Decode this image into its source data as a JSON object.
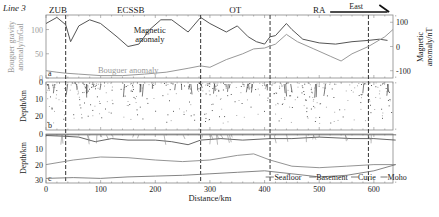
{
  "figure": {
    "line_label": "Line 3",
    "xlabel": "Distance/km",
    "direction_label": "East",
    "regions": [
      "ZUB",
      "ECSSB",
      "OT",
      "RA"
    ],
    "boundaries_km": [
      36,
      283,
      410,
      590
    ],
    "panel_letters": [
      "a",
      "b",
      "c"
    ]
  },
  "chart_data": [
    {
      "type": "line",
      "panel": "a",
      "title": "",
      "xlabel": "Distance/km",
      "ylabel_left": "Bouguer gravity anomaly/mGal",
      "ylabel_right": "Magnetic anomaly/nT",
      "xlim": [
        0,
        640
      ],
      "ylim_left": [
        0,
        130
      ],
      "ylim_right": [
        -130,
        130
      ],
      "left_ticks": [
        "0",
        "50",
        "100"
      ],
      "right_ticks": [
        "-100",
        "0",
        "100"
      ],
      "annotations": [
        "Magnetic anomaly",
        "Bouguer anomaly"
      ],
      "series": [
        {
          "name": "Magnetic anomaly",
          "axis": "right",
          "color": "#555555",
          "x": [
            0,
            20,
            36,
            45,
            60,
            80,
            100,
            130,
            150,
            170,
            190,
            210,
            230,
            260,
            283,
            300,
            330,
            350,
            370,
            385,
            400,
            410,
            420,
            440,
            450,
            470,
            500,
            530,
            560,
            590,
            610,
            625
          ],
          "values": [
            95,
            120,
            90,
            20,
            85,
            110,
            95,
            40,
            0,
            10,
            70,
            110,
            110,
            60,
            120,
            95,
            60,
            85,
            40,
            20,
            10,
            40,
            45,
            95,
            70,
            30,
            15,
            10,
            20,
            25,
            30,
            25
          ]
        },
        {
          "name": "Bouguer anomaly",
          "axis": "left",
          "color": "#999999",
          "x": [
            0,
            20,
            36,
            60,
            100,
            140,
            180,
            220,
            260,
            283,
            300,
            330,
            360,
            380,
            400,
            420,
            440,
            460,
            490,
            520,
            540,
            560,
            590,
            620,
            635
          ],
          "values": [
            15,
            12,
            10,
            8,
            5,
            5,
            8,
            12,
            20,
            25,
            22,
            38,
            50,
            60,
            62,
            70,
            90,
            75,
            60,
            45,
            35,
            50,
            65,
            85,
            100
          ]
        }
      ]
    },
    {
      "type": "scatter",
      "panel": "b",
      "ylabel": "Depth/km",
      "xlim": [
        0,
        640
      ],
      "ylim": [
        28,
        0
      ],
      "y_ticks": [
        "0",
        "10",
        "20"
      ],
      "description": "Euler deconvolution solution points"
    },
    {
      "type": "line",
      "panel": "c",
      "ylabel": "Depth/km",
      "xlabel": "Distance/km",
      "xlim": [
        0,
        640
      ],
      "ylim": [
        32,
        0
      ],
      "x_ticks": [
        "0",
        "100",
        "200",
        "300",
        "400",
        "500",
        "600"
      ],
      "y_ticks": [
        "0",
        "10",
        "20",
        "30"
      ],
      "legend": [
        "Seafloor",
        "Basement",
        "Curie",
        "Moho"
      ],
      "series": [
        {
          "name": "Seafloor",
          "x": [
            0,
            640
          ],
          "values": [
            0.5,
            0.5
          ]
        },
        {
          "name": "Basement",
          "x": [
            0,
            36,
            60,
            90,
            120,
            150,
            200,
            230,
            260,
            283,
            320,
            360,
            410,
            450,
            500,
            560,
            600,
            640
          ],
          "values": [
            1,
            1.5,
            2,
            5,
            3,
            4,
            4,
            5,
            7,
            4,
            3,
            4,
            3,
            3,
            2,
            3,
            3,
            4
          ]
        },
        {
          "name": "Curie",
          "x": [
            0,
            50,
            100,
            150,
            200,
            250,
            300,
            350,
            380,
            410,
            450,
            500,
            550,
            600,
            640
          ],
          "values": [
            20,
            17,
            15,
            15.5,
            17,
            18,
            17,
            14,
            13,
            17,
            21,
            22,
            21,
            20,
            20
          ]
        },
        {
          "name": "Moho",
          "x": [
            0,
            50,
            100,
            150,
            200,
            250,
            300,
            350,
            400,
            450,
            500,
            550,
            600,
            640
          ],
          "values": [
            29,
            28.5,
            29,
            28,
            27.5,
            27,
            26,
            25,
            24,
            26,
            28,
            27,
            24,
            20
          ]
        }
      ]
    }
  ]
}
